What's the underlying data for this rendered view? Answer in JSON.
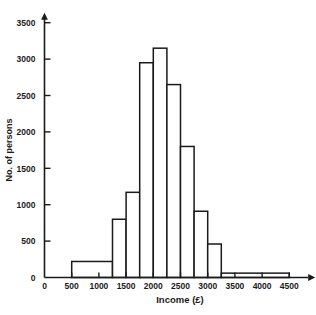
{
  "chart_data": {
    "type": "bar",
    "title": "",
    "subtitle": "",
    "xlabel": "Income (£)",
    "ylabel": "No. of persons",
    "xlim": [
      0,
      4700
    ],
    "ylim": [
      0,
      3500
    ],
    "grid": false,
    "legend": null,
    "xticks": [
      0,
      500,
      1000,
      1500,
      2000,
      2500,
      3000,
      3500,
      4000,
      4500
    ],
    "xticklabels": [
      "0",
      "500",
      "1000",
      "1500",
      "2000",
      "2500",
      "3000",
      "3500",
      "4000",
      "4500"
    ],
    "yticks": [
      0,
      500,
      1000,
      1500,
      2000,
      2500,
      3000,
      3500
    ],
    "yticklabels": [
      "0",
      "500",
      "1000",
      "1500",
      "2000",
      "2500",
      "3000",
      "3500"
    ],
    "bins": [
      {
        "label": "500-1250",
        "start": 500,
        "end": 1250,
        "value": 220
      },
      {
        "label": "1250-1500",
        "start": 1250,
        "end": 1500,
        "value": 800
      },
      {
        "label": "1500-1750",
        "start": 1500,
        "end": 1750,
        "value": 1170
      },
      {
        "label": "1750-2000",
        "start": 1750,
        "end": 2000,
        "value": 2950
      },
      {
        "label": "2000-2250",
        "start": 2000,
        "end": 2250,
        "value": 3150
      },
      {
        "label": "2250-2500",
        "start": 2250,
        "end": 2500,
        "value": 2650
      },
      {
        "label": "2500-2750",
        "start": 2500,
        "end": 2750,
        "value": 1800
      },
      {
        "label": "2750-3000",
        "start": 2750,
        "end": 3000,
        "value": 910
      },
      {
        "label": "3000-3250",
        "start": 3000,
        "end": 3250,
        "value": 460
      },
      {
        "label": "3250-4500",
        "start": 3250,
        "end": 4500,
        "value": 60
      }
    ],
    "colors": {
      "bar_fill": "#ffffff",
      "bar_stroke": "#1a1a1a",
      "axis": "#1a1a1a",
      "background": "#ffffff"
    }
  }
}
